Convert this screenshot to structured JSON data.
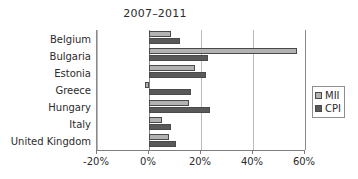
{
  "chart_data": {
    "type": "bar",
    "orientation": "horizontal",
    "title": "2007–2011",
    "xlabel": "",
    "ylabel": "",
    "xlim": [
      -20,
      60
    ],
    "xticks": [
      -20,
      0,
      20,
      40,
      60
    ],
    "xticklabels": [
      "-20%",
      "0%",
      "20%",
      "40%",
      "60%"
    ],
    "grid": true,
    "legend_position": "right",
    "categories": [
      "Belgium",
      "Bulgaria",
      "Estonia",
      "Greece",
      "Hungary",
      "Italy",
      "United Kingdom"
    ],
    "series": [
      {
        "name": "MII",
        "color": "#b2b2b2",
        "values": [
          8.5,
          57.0,
          17.5,
          -1.5,
          15.5,
          5.0,
          7.5
        ]
      },
      {
        "name": "CPI",
        "color": "#595959",
        "values": [
          12.0,
          22.5,
          22.0,
          16.0,
          23.5,
          8.5,
          10.5
        ]
      }
    ]
  },
  "legend": {
    "entries": [
      {
        "label": "MII"
      },
      {
        "label": "CPI"
      }
    ]
  },
  "colors": {
    "mii": "#b2b2b2",
    "cpi": "#595959",
    "axis": "#8a8a8a",
    "grid": "#b9b9b9",
    "text": "#2b2b2b"
  }
}
